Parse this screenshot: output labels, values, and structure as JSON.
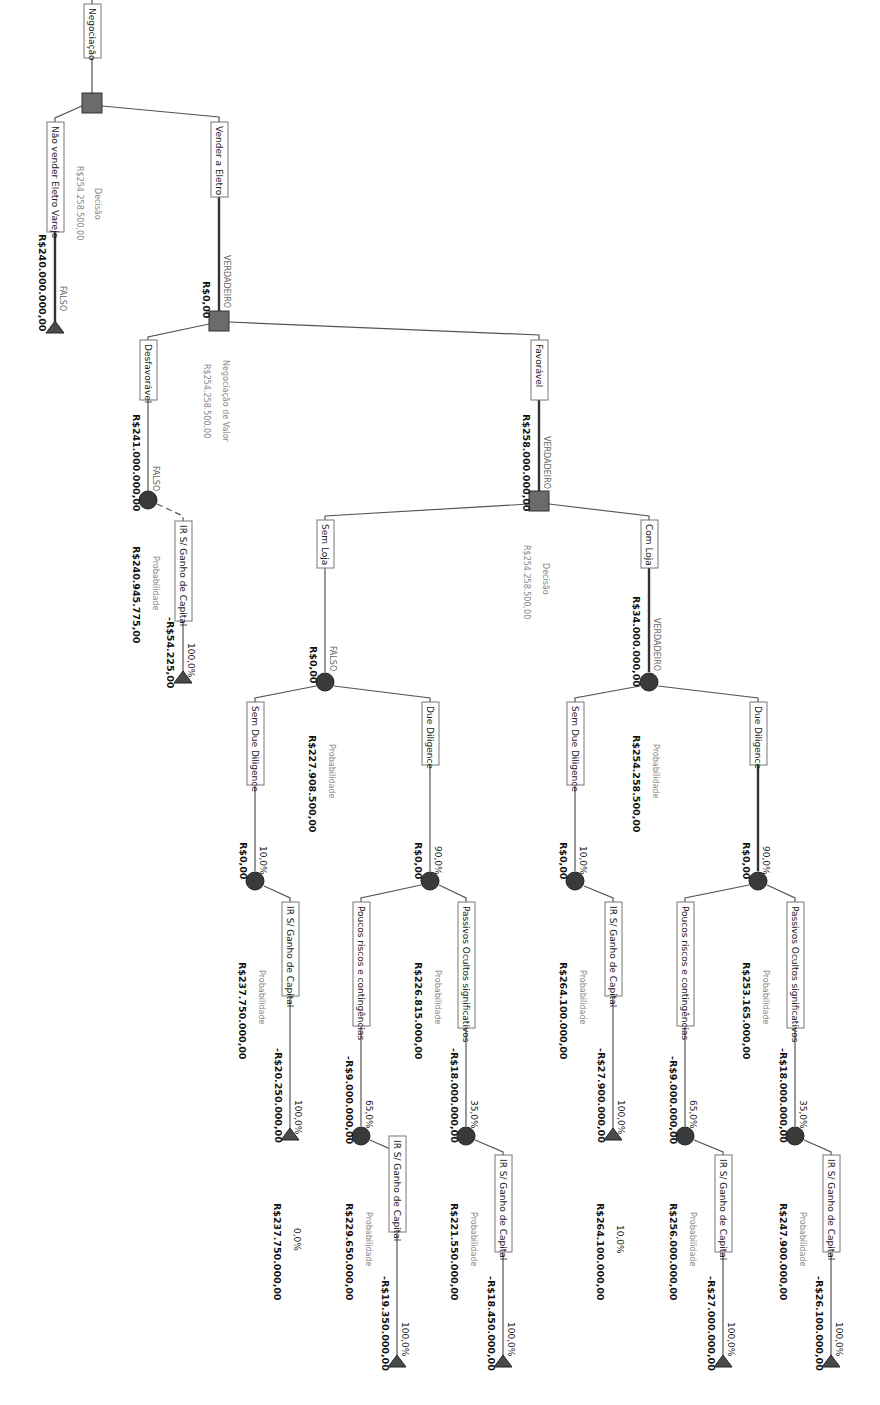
{
  "diagram": {
    "type": "decision-tree",
    "orientation": "rotated-90-clockwise",
    "colors": {
      "decision_node": "#6b6b6b",
      "chance_node": "#3a3a3a",
      "terminal_node": "#4a4a4a",
      "edge": "#555555",
      "label_border": "#777777"
    },
    "root": {
      "label": "Negociação",
      "node_kind": "Decisão",
      "node_value": "R$254.258.500,00"
    },
    "branches": {
      "nao_vender": {
        "label": "Não vender Eletro Varejo",
        "flag": "FALSO",
        "payoff": "R$240.000.000,00"
      },
      "vender": {
        "label": "Vender a Eletro",
        "flag": "VERDADEIRO",
        "payoff": "R$0,00",
        "node_kind": "Negociação de Valor",
        "node_value": "R$254.258.500,00"
      },
      "desfavoravel": {
        "label": "Desfavorável",
        "flag": "FALSO",
        "payoff": "R$241.000.000,00",
        "node_kind": "Probabilidade",
        "node_value": "R$240.945.775,00",
        "ir": {
          "label": "IR S/ Ganho de Capital",
          "prob": "100,0%",
          "payoff": "-R$54.225,00"
        }
      },
      "favoravel": {
        "label": "Favorável",
        "flag": "VERDADEIRO",
        "payoff": "R$258.000.000,00",
        "node_kind": "Decisão",
        "node_value": "R$254.258.500,00"
      },
      "sem_loja": {
        "label": "Sem Loja",
        "flag": "FALSO",
        "payoff": "R$0,00",
        "node_kind": "Probabilidade",
        "node_value": "R$227.908.500,00",
        "sem_dd": {
          "label": "Sem Due Diligence",
          "prob": "10,0%",
          "payoff": "R$0,00",
          "node_kind": "Probabilidade",
          "node_value": "R$237.750.000,00",
          "ir": {
            "label": "IR S/ Ganho de Capital",
            "prob": "100,0%",
            "payoff": "-R$20.250.000,00",
            "end_prob": "0,0%",
            "end_value": "R$237.750.000,00"
          }
        },
        "dd": {
          "label": "Due Diligence",
          "prob": "90,0%",
          "payoff": "R$0,00",
          "node_kind": "Probabilidade",
          "node_value": "R$226.815.000,00",
          "poucos": {
            "label": "Poucos riscos e contingências",
            "prob": "65,0%",
            "payoff": "-R$9.000.000,00",
            "node_kind": "Probabilidade",
            "node_value": "R$229.650.000,00",
            "ir": {
              "label": "IR S/ Ganho de Capital",
              "prob": "100,0%",
              "payoff": "-R$19.350.000,00"
            }
          },
          "passivos": {
            "label": "Passivos Ocultos significativos",
            "prob": "35,0%",
            "payoff": "-R$18.000.000,00",
            "node_kind": "Probabilidade",
            "node_value": "R$221.550.000,00",
            "ir": {
              "label": "IR S/ Ganho de Capital",
              "prob": "100,0%",
              "payoff": "-R$18.450.000,00"
            }
          }
        }
      },
      "com_loja": {
        "label": "Com Loja",
        "flag": "VERDADEIRO",
        "payoff": "R$34.000.000,00",
        "node_kind": "Probabilidade",
        "node_value": "R$254.258.500,00",
        "sem_dd": {
          "label": "Sem Due Diligence",
          "prob": "10,0%",
          "payoff": "R$0,00",
          "node_kind": "Probabilidade",
          "node_value": "R$264.100.000,00",
          "ir": {
            "label": "IR S/ Ganho de Capital",
            "prob": "100,0%",
            "payoff": "-R$27.900.000,00",
            "end_prob": "10,0%",
            "end_value": "R$264.100.000,00"
          }
        },
        "dd": {
          "label": "Due Diligence",
          "prob": "90,0%",
          "payoff": "R$0,00",
          "node_kind": "Probabilidade",
          "node_value": "R$253.165.000,00",
          "poucos": {
            "label": "Poucos riscos e contingências",
            "prob": "65,0%",
            "payoff": "-R$9.000.000,00",
            "node_kind": "Probabilidade",
            "node_value": "R$256.000.000,00",
            "ir": {
              "label": "IR S/ Ganho de Capital",
              "prob": "100,0%",
              "payoff": "-R$27.000.000,00"
            }
          },
          "passivos": {
            "label": "Passivos Ocultos significativos",
            "prob": "35,0%",
            "payoff": "-R$18.000.000,00",
            "node_kind": "Probabilidade",
            "node_value": "R$247.900.000,00",
            "ir": {
              "label": "IR S/ Ganho de Capital",
              "prob": "100,0%",
              "payoff": "-R$26.100.000,00"
            }
          }
        }
      }
    }
  }
}
